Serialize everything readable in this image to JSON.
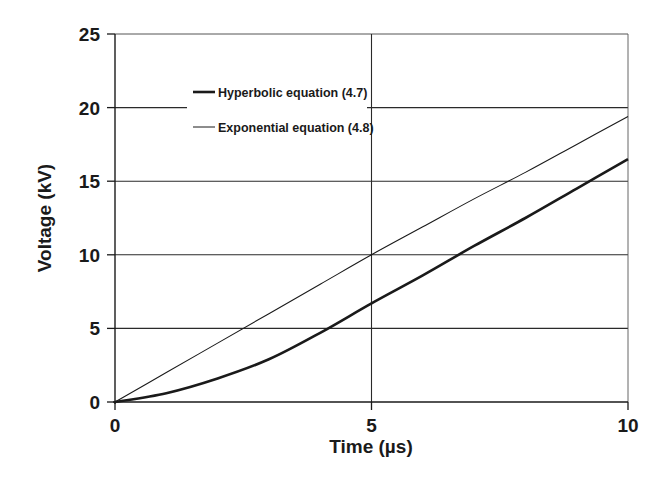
{
  "chart_data": {
    "type": "line",
    "title": "",
    "xlabel": "Time (µs)",
    "ylabel": "Voltage (kV)",
    "xlim": [
      0,
      10
    ],
    "ylim": [
      0,
      25
    ],
    "x_ticks": [
      "0",
      "5",
      "10"
    ],
    "y_ticks": [
      "0",
      "5",
      "10",
      "15",
      "20",
      "25"
    ],
    "grid": {
      "horizontal": true,
      "vertical": true
    },
    "legend_position": "upper-left inside",
    "x": [
      0,
      1,
      2,
      3,
      4,
      5,
      6,
      7,
      8,
      9,
      10
    ],
    "series": [
      {
        "name": "Hyperbolic equation (4.7)",
        "style": "thick",
        "values": [
          0,
          0.6,
          1.6,
          2.9,
          4.7,
          6.7,
          8.6,
          10.6,
          12.5,
          14.5,
          16.5
        ]
      },
      {
        "name": "Exponential equation (4.8)",
        "style": "thin",
        "values": [
          0,
          2.0,
          4.0,
          6.0,
          8.0,
          10.0,
          11.9,
          13.8,
          15.6,
          17.5,
          19.4
        ]
      }
    ]
  },
  "colors": {
    "line": "#1a1a1a",
    "grid": "#2a2a2a",
    "background": "#ffffff"
  }
}
